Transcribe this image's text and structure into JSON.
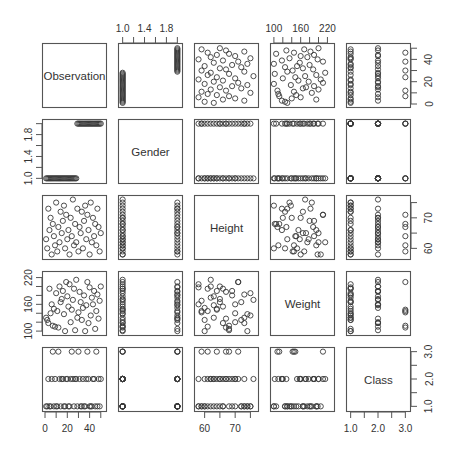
{
  "chart_data": {
    "type": "scatter",
    "subtype": "scatterplot-matrix",
    "title": "",
    "variables": [
      "Observation",
      "Gender",
      "Height",
      "Weight",
      "Class"
    ],
    "axes": {
      "Observation": {
        "range": [
          0,
          52
        ],
        "ticks": [
          0,
          20,
          40
        ],
        "minor_ticks": [
          0,
          10,
          20,
          30,
          40,
          50
        ]
      },
      "Gender": {
        "range": [
          0.97,
          2.03
        ],
        "ticks": [
          1.0,
          1.4,
          1.8
        ],
        "minor_ticks": [
          1.0,
          1.2,
          1.4,
          1.6,
          1.8,
          2.0
        ],
        "tick_labels": [
          "1.0",
          "1.4",
          "1.8"
        ]
      },
      "Height": {
        "range": [
          57.5,
          76.5
        ],
        "ticks": [
          60,
          70
        ],
        "minor_ticks": [
          60,
          65,
          70,
          75
        ]
      },
      "Weight": {
        "range": [
          98,
          228
        ],
        "ticks": [
          100,
          160,
          220
        ],
        "minor_ticks": [
          100,
          120,
          140,
          160,
          180,
          200,
          220
        ]
      },
      "Class": {
        "range": [
          0.94,
          3.06
        ],
        "ticks": [
          1.0,
          2.0,
          3.0
        ],
        "minor_ticks": [
          1.0,
          1.5,
          2.0,
          2.5,
          3.0
        ],
        "tick_labels": [
          "1.0",
          "2.0",
          "3.0"
        ]
      }
    },
    "axis_placement": {
      "top": [
        "Gender",
        "Weight"
      ],
      "bottom": [
        "Observation",
        "Height",
        "Class"
      ],
      "left": [
        "Gender",
        "Weight"
      ],
      "right": [
        "Observation",
        "Height",
        "Class"
      ]
    },
    "data": {
      "Observation": [
        1,
        2,
        3,
        4,
        5,
        6,
        7,
        8,
        9,
        10,
        11,
        12,
        13,
        14,
        15,
        16,
        17,
        18,
        19,
        20,
        21,
        22,
        23,
        24,
        25,
        26,
        27,
        28,
        29,
        30,
        31,
        32,
        33,
        34,
        35,
        36,
        37,
        38,
        39,
        40,
        41,
        42,
        43,
        44,
        45,
        46,
        47,
        48,
        49,
        50
      ],
      "Gender": [
        1,
        1,
        1,
        1,
        1,
        1,
        1,
        1,
        1,
        1,
        1,
        1,
        1,
        1,
        1,
        1,
        1,
        1,
        1,
        1,
        1,
        1,
        1,
        1,
        1,
        1,
        1,
        1,
        2,
        2,
        2,
        2,
        2,
        2,
        2,
        2,
        2,
        2,
        2,
        2,
        2,
        2,
        2,
        2,
        2,
        2,
        2,
        2,
        2,
        2
      ],
      "Height": [
        63,
        60,
        73,
        66,
        70,
        58,
        68,
        64,
        61,
        75,
        59,
        67,
        62,
        72,
        65,
        69,
        74,
        60,
        71,
        63,
        66,
        58,
        70,
        64,
        76,
        61,
        68,
        62,
        73,
        59,
        67,
        65,
        72,
        60,
        69,
        74,
        63,
        71,
        66,
        58,
        75,
        62,
        70,
        64,
        68,
        61,
        73,
        67,
        59,
        65
      ],
      "Weight": [
        130,
        125,
        118,
        195,
        140,
        160,
        112,
        150,
        110,
        185,
        145,
        108,
        200,
        165,
        172,
        190,
        138,
        100,
        210,
        178,
        155,
        205,
        120,
        148,
        170,
        195,
        102,
        215,
        130,
        142,
        188,
        165,
        125,
        152,
        180,
        100,
        158,
        210,
        118,
        198,
        135,
        175,
        160,
        190,
        105,
        145,
        182,
        128,
        168,
        200
      ],
      "Class": [
        1,
        1,
        2,
        1,
        1,
        2,
        3,
        1,
        2,
        1,
        1,
        3,
        2,
        1,
        2,
        2,
        1,
        1,
        2,
        2,
        1,
        1,
        2,
        3,
        2,
        1,
        2,
        2,
        1,
        3,
        2,
        1,
        1,
        2,
        1,
        1,
        2,
        3,
        2,
        1,
        1,
        1,
        2,
        2,
        1,
        3,
        1,
        2,
        1,
        2
      ]
    },
    "grid": false,
    "legend": null,
    "marker": "open-circle",
    "colors": {
      "marker": "#3a3a3a",
      "frame": "#555555",
      "text": "#333333",
      "background": "#ffffff"
    }
  }
}
